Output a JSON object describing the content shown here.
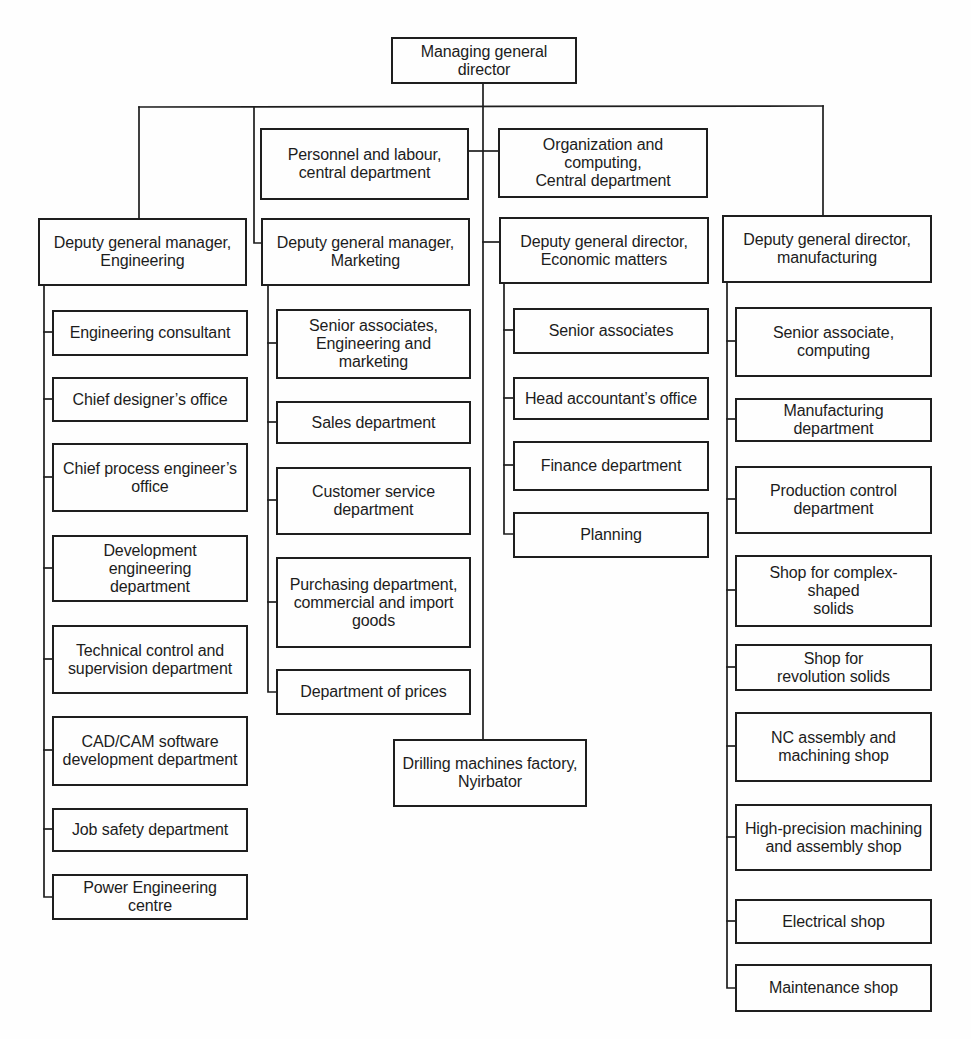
{
  "org": {
    "root": {
      "label": "Managing general\ndirector"
    },
    "staff": [
      {
        "label": "Personnel and labour,\ncentral department"
      },
      {
        "label": "Organization and\ncomputing,\nCentral department"
      }
    ],
    "divisions": [
      {
        "head": "Deputy general manager,\nEngineering",
        "units": [
          "Engineering consultant",
          "Chief designer’s office",
          "Chief process engineer’s\noffice",
          "Development\nengineering\ndepartment",
          "Technical control and\nsupervision department",
          "CAD/CAM software\ndevelopment department",
          "Job safety department",
          "Power Engineering\ncentre"
        ]
      },
      {
        "head": "Deputy general manager,\nMarketing",
        "units": [
          "Senior associates,\nEngineering and\nmarketing",
          "Sales department",
          "Customer service\ndepartment",
          "Purchasing department,\ncommercial and import\ngoods",
          "Department of prices"
        ]
      },
      {
        "head": "Deputy general director,\nEconomic matters",
        "units": [
          "Senior associates",
          "Head accountant’s office",
          "Finance department",
          "Planning"
        ]
      },
      {
        "head": "Deputy general director,\nmanufacturing",
        "units": [
          "Senior associate,\ncomputing",
          "Manufacturing\ndepartment",
          "Production control\ndepartment",
          "Shop for complex-\nshaped\nsolids",
          "Shop for\nrevolution solids",
          "NC assembly and\nmachining shop",
          "High-precision machining\nand assembly shop",
          "Electrical shop",
          "Maintenance shop"
        ]
      }
    ],
    "factory": {
      "label": "Drilling machines factory,\nNyirbator"
    }
  },
  "colors": {
    "line": "#1e1e1e",
    "background": "#fefefe",
    "text": "#1c1c1c"
  }
}
